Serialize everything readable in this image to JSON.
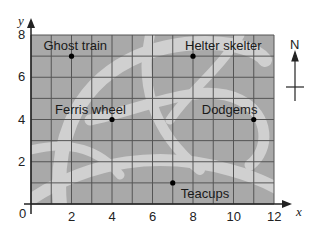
{
  "map": {
    "title": "",
    "x_axis_label": "x",
    "y_axis_label": "y",
    "x_ticks": [
      "0",
      "2",
      "4",
      "6",
      "8",
      "10",
      "12"
    ],
    "y_ticks": [
      "2",
      "4",
      "6",
      "8"
    ],
    "origin_label": "0",
    "x_range": [
      0,
      12
    ],
    "y_range": [
      0,
      8
    ],
    "grid_step": 1,
    "compass_label": "N",
    "colors": {
      "background": "#a9a9a9",
      "paths": "#d0d0d0",
      "grid": "#555555",
      "points": "#000000"
    },
    "locations": [
      {
        "name": "Ghost train",
        "x": 2,
        "y": 7
      },
      {
        "name": "Helter skelter",
        "x": 8,
        "y": 7
      },
      {
        "name": "Ferris wheel",
        "x": 4,
        "y": 4
      },
      {
        "name": "Dodgems",
        "x": 11,
        "y": 4
      },
      {
        "name": "Teacups",
        "x": 7,
        "y": 1
      }
    ]
  }
}
